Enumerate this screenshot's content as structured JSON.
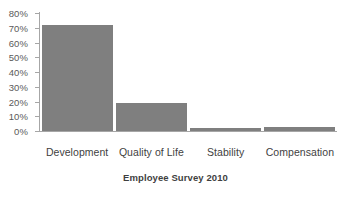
{
  "chart_data": {
    "type": "bar",
    "title": "",
    "xlabel": "Employee Survey 2010",
    "ylabel": "",
    "categories": [
      "Development",
      "Quality of Life",
      "Stability",
      "Compensation"
    ],
    "values": [
      72,
      19,
      2,
      3
    ],
    "value_unit": "%",
    "ylim": [
      0,
      80
    ],
    "y_ticks": [
      0,
      10,
      20,
      30,
      40,
      50,
      60,
      70,
      80
    ],
    "y_tick_labels": [
      "0%",
      "10%",
      "20%",
      "30%",
      "40%",
      "50%",
      "60%",
      "70%",
      "80%"
    ],
    "grid": false,
    "legend": false,
    "legend_position": "none",
    "series": [
      {
        "name": "Employee Survey 2010",
        "color": "#7F7F7F",
        "values": [
          72,
          19,
          2,
          3
        ]
      }
    ]
  },
  "colors": {
    "bar": "#7F7F7F",
    "axis": "#A6A6A6",
    "tick_text": "#5A5A5A",
    "label_text": "#3F3F3F",
    "background": "#FFFFFF"
  }
}
